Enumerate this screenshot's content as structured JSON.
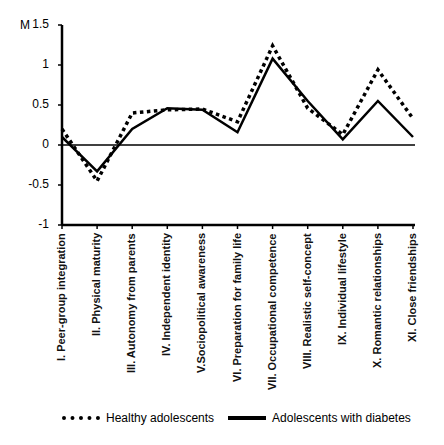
{
  "chart_data": {
    "type": "line",
    "title": "",
    "ylabel": "M",
    "xlabel": "",
    "ylim": [
      -1,
      1.5
    ],
    "yticks": [
      "1.5",
      "1",
      "0.5",
      "0",
      "-0.5",
      "-1"
    ],
    "grid": false,
    "legend_position": "bottom",
    "categories": [
      "I. Peer-group integration",
      "II. Physical maturity",
      "III. Autonomy from parents",
      "IV. Independent identity",
      "V.Sociopolitical awareness",
      "VI. Preparation for family life",
      "VII. Occupational competence",
      "VIII. Realistic self-concept",
      "IX. Individual lifestyle",
      "X. Romantic relationships",
      "XI. Close friendships"
    ],
    "series": [
      {
        "name": "Healthy adolescents",
        "style": "dotted",
        "values": [
          0.2,
          -0.45,
          0.4,
          0.44,
          0.45,
          0.29,
          1.24,
          0.46,
          0.13,
          0.94,
          0.33
        ]
      },
      {
        "name": "Adolescents with diabetes",
        "style": "solid",
        "values": [
          0.1,
          -0.33,
          0.2,
          0.46,
          0.44,
          0.16,
          1.08,
          0.55,
          0.07,
          0.55,
          0.1
        ]
      }
    ]
  },
  "legend": {
    "healthy": "Healthy adolescents",
    "diabetes": "Adolescents with diabetes"
  },
  "axis": {
    "y_title": "M"
  }
}
